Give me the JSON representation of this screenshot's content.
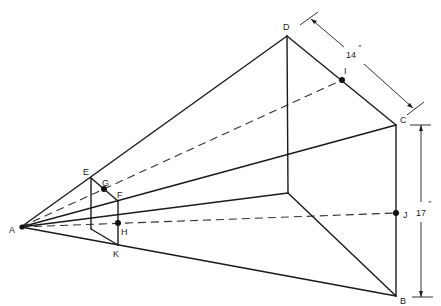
{
  "diagram": {
    "type": "perspective-projection",
    "colors": {
      "line": "#1a1a1a",
      "background": "#ffffff"
    },
    "points": {
      "A": {
        "label": "A",
        "x": 21,
        "y": 227,
        "lx": 9,
        "ly": 233
      },
      "B": {
        "label": "B",
        "x": 396,
        "y": 296,
        "lx": 400,
        "ly": 304
      },
      "C": {
        "label": "C",
        "x": 396,
        "y": 125,
        "lx": 400,
        "ly": 123
      },
      "D": {
        "label": "D",
        "x": 287,
        "y": 36,
        "lx": 283,
        "ly": 30
      },
      "E": {
        "label": "E",
        "x": 91,
        "y": 178,
        "lx": 83,
        "ly": 175
      },
      "F": {
        "label": "F",
        "x": 118,
        "y": 201,
        "lx": 118,
        "ly": 198
      },
      "G": {
        "label": "G",
        "x": 104,
        "y": 189,
        "lx": 102,
        "ly": 186
      },
      "H": {
        "label": "H",
        "x": 118,
        "y": 223,
        "lx": 121,
        "ly": 235
      },
      "I": {
        "label": "I",
        "x": 342,
        "y": 80,
        "lx": 344,
        "ly": 74
      },
      "J": {
        "label": "J",
        "x": 396,
        "y": 213,
        "lx": 403,
        "ly": 218
      },
      "K": {
        "label": "K",
        "x": 118,
        "y": 245,
        "lx": 113,
        "ly": 257
      },
      "P": {
        "label": "",
        "x": 288,
        "y": 193
      },
      "Q": {
        "label": "",
        "x": 91,
        "y": 229
      }
    },
    "dimensions": {
      "width_label": "14",
      "width_unit": "″",
      "height_label": "17",
      "height_unit": "″"
    }
  }
}
